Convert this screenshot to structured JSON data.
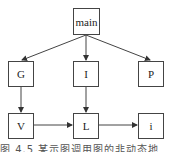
{
  "diagram": {
    "type": "call-graph",
    "nodes": [
      {
        "id": "main",
        "label": "main"
      },
      {
        "id": "G",
        "label": "G"
      },
      {
        "id": "I",
        "label": "I"
      },
      {
        "id": "P",
        "label": "P"
      },
      {
        "id": "V",
        "label": "V"
      },
      {
        "id": "L",
        "label": "L"
      },
      {
        "id": "i",
        "label": "i"
      }
    ],
    "edges": [
      {
        "from": "main",
        "to": "G"
      },
      {
        "from": "main",
        "to": "I"
      },
      {
        "from": "main",
        "to": "P"
      },
      {
        "from": "G",
        "to": "V"
      },
      {
        "from": "I",
        "to": "L"
      },
      {
        "from": "V",
        "to": "L"
      },
      {
        "from": "L",
        "to": "i"
      }
    ],
    "caption": "图 4.5  某示图调用图的非动态地"
  }
}
